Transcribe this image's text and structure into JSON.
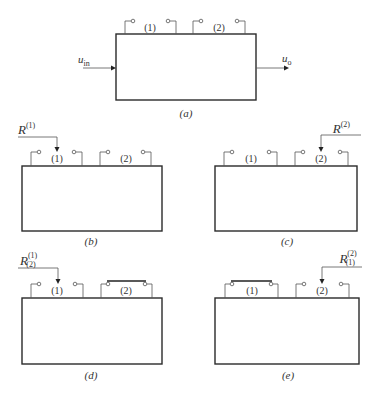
{
  "figure": {
    "panels": [
      {
        "id": "a",
        "caption": "(a)",
        "port_labels": [
          "(1)",
          "(2)"
        ],
        "input_signal": {
          "base": "u",
          "sub": "in"
        },
        "output_signal": {
          "base": "u",
          "sub": "o"
        }
      },
      {
        "id": "b",
        "caption": "(b)",
        "port_labels": [
          "(1)",
          "(2)"
        ],
        "probe": {
          "base": "R",
          "sup": "(1)",
          "sub": "",
          "target_port": "(1)",
          "side": "left"
        }
      },
      {
        "id": "c",
        "caption": "(c)",
        "port_labels": [
          "(1)",
          "(2)"
        ],
        "probe": {
          "base": "R",
          "sup": "(2)",
          "sub": "",
          "target_port": "(2)",
          "side": "right"
        }
      },
      {
        "id": "d",
        "caption": "(d)",
        "port_labels": [
          "(1)",
          "(2)"
        ],
        "shorted_port": "(2)",
        "probe": {
          "base": "R",
          "sup": "(1)",
          "sub": "(2)",
          "target_port": "(1)",
          "side": "left"
        }
      },
      {
        "id": "e",
        "caption": "(e)",
        "port_labels": [
          "(1)",
          "(2)"
        ],
        "shorted_port": "(1)",
        "probe": {
          "base": "R",
          "sup": "(2)",
          "sub": "(1)",
          "target_port": "(2)",
          "side": "right"
        }
      }
    ]
  }
}
